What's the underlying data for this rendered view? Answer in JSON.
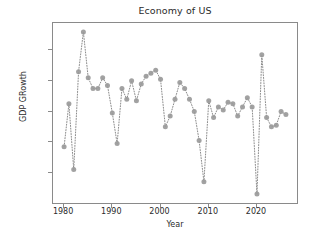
{
  "chart_data": {
    "type": "line",
    "title": "Economy of US",
    "xlabel": "Year",
    "ylabel": "GDP GRowth",
    "grid": false,
    "legend": null,
    "marker": "circle",
    "linestyle": "dotted",
    "series_color": "#8c8c8c",
    "marker_color": "#9a9a9a",
    "xlim": [
      1978.2,
      1987.0
    ],
    "ylim": [
      -0.0385,
      0.0795
    ],
    "xticks": [
      1980,
      1990,
      2000,
      2010,
      2020
    ],
    "xtick_labels": [
      "1980",
      "1990",
      "2000",
      "2010",
      "2020"
    ],
    "yticks": [
      -0.02,
      0.0,
      0.02,
      0.04,
      0.06
    ],
    "ytick_labels": [
      "-0.02",
      "0.00",
      "0.02",
      "0.04",
      "0.06"
    ],
    "x": [
      1980,
      1981,
      1982,
      1983,
      1984,
      1985,
      1986,
      1987,
      1988,
      1989,
      1990,
      1991,
      1992,
      1993,
      1994,
      1995,
      1996,
      1997,
      1998,
      1999,
      2000,
      2001,
      2002,
      2003,
      2004,
      2005,
      2006,
      2007,
      2008,
      2009,
      2010,
      2011,
      2012,
      2013,
      2014,
      2015,
      2016,
      2017,
      2018,
      2019,
      2020,
      2021,
      2022,
      2023,
      2024,
      2025,
      2026
    ],
    "values": [
      -0.003,
      0.025,
      -0.018,
      0.046,
      0.072,
      0.042,
      0.035,
      0.035,
      0.042,
      0.037,
      0.019,
      -0.001,
      0.035,
      0.028,
      0.04,
      0.027,
      0.038,
      0.043,
      0.045,
      0.047,
      0.041,
      0.01,
      0.017,
      0.028,
      0.039,
      0.035,
      0.028,
      0.02,
      0.001,
      -0.026,
      0.027,
      0.016,
      0.023,
      0.021,
      0.026,
      0.025,
      0.017,
      0.023,
      0.029,
      0.023,
      -0.034,
      0.057,
      0.016,
      0.01,
      0.011,
      0.02,
      0.018
    ],
    "point_count": 47
  },
  "figure": {
    "background": "#ffffff",
    "axes_edge_color": "#8a8a8a"
  }
}
